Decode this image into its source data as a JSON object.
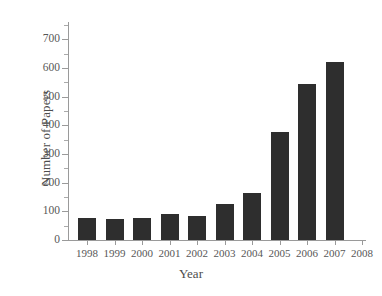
{
  "chart_data": {
    "type": "bar",
    "title": "",
    "xlabel": "Year",
    "ylabel": "Number of Papers",
    "categories": [
      "1998",
      "1999",
      "2000",
      "2001",
      "2002",
      "2003",
      "2004",
      "2005",
      "2006",
      "2007"
    ],
    "values": [
      78,
      73,
      75,
      90,
      85,
      125,
      165,
      377,
      545,
      620
    ],
    "x_tick_labels": [
      "1998",
      "1999",
      "2000",
      "2001",
      "2002",
      "2003",
      "2004",
      "2005",
      "2006",
      "2007",
      "2008"
    ],
    "y_tick_labels": [
      "0",
      "100",
      "200",
      "300",
      "400",
      "500",
      "600",
      "700"
    ],
    "y_tick_values": [
      0,
      100,
      200,
      300,
      400,
      500,
      600,
      700
    ],
    "y_minor_tick_values": [
      50,
      150,
      250,
      350,
      450,
      550,
      650,
      750
    ],
    "ylim": [
      0,
      760
    ],
    "grid": false,
    "legend": false,
    "bar_color": "#2e2e2e",
    "axis_color": "#9a9a9a",
    "text_color": "#575757"
  },
  "caption_sliver": "                                                                                                                          "
}
